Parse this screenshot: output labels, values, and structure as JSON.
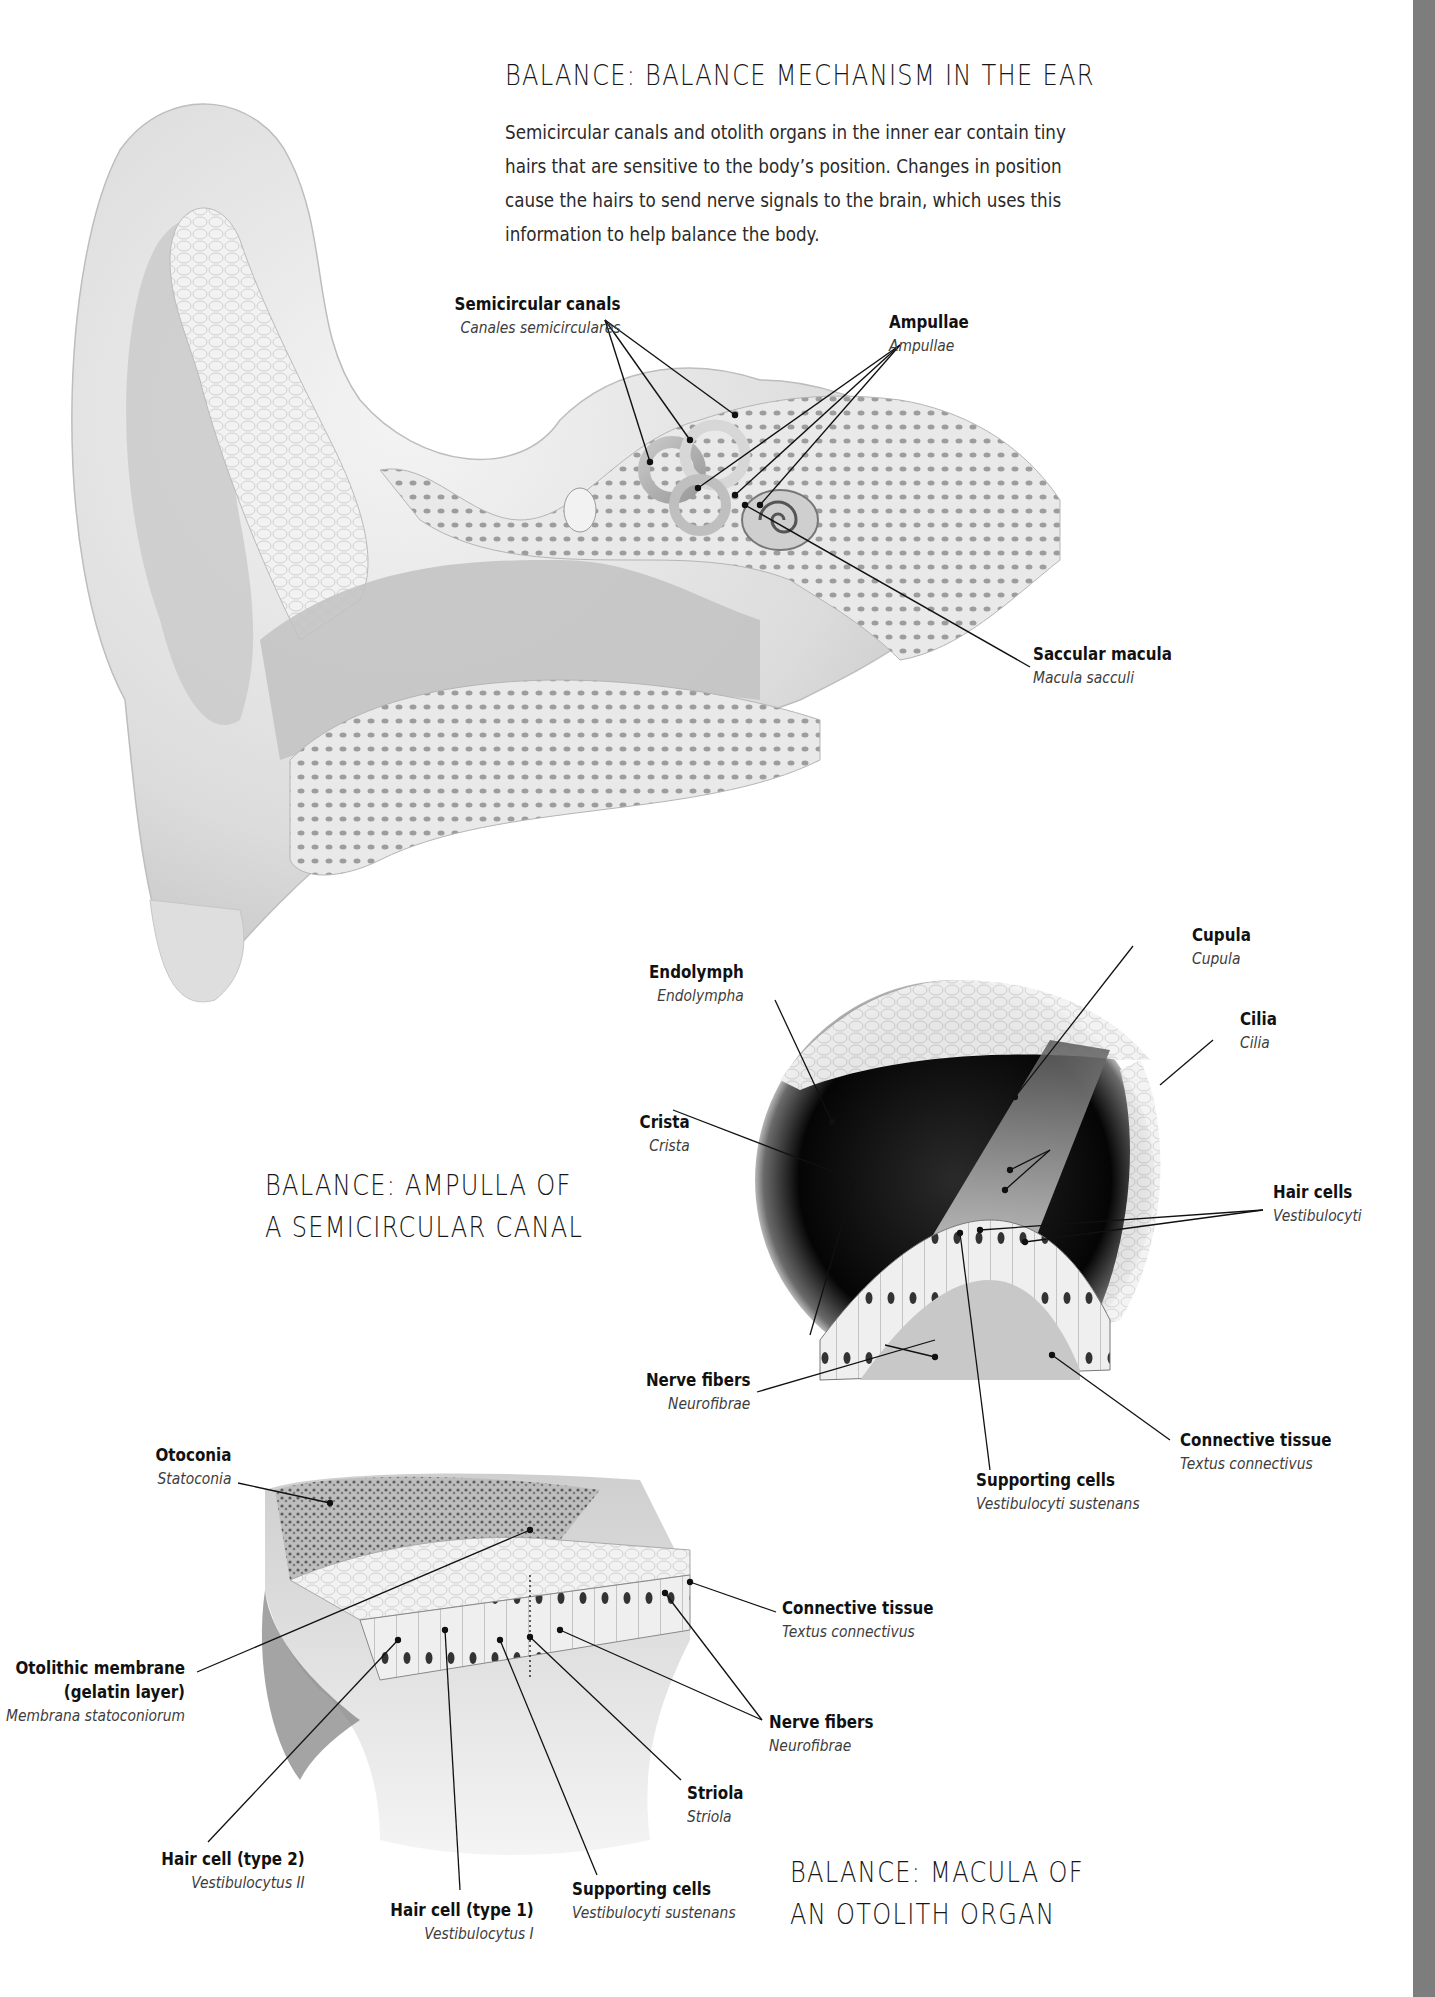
{
  "page": {
    "side_bar_color": "#7d7d7d",
    "background": "#ffffff"
  },
  "section1": {
    "title": "BALANCE: BALANCE MECHANISM IN THE EAR",
    "intro_lines": [
      "Semicircular canals and otolith organs in the inner ear contain tiny",
      "hairs that are sensitive to the body’s position. Changes in position",
      "cause the hairs to send nerve signals to the brain, which uses this",
      "information to help balance the body."
    ],
    "labels": [
      {
        "en": "Semicircular canals",
        "la": "Canales semicirculares"
      },
      {
        "en": "Ampullae",
        "la": "Ampullae"
      },
      {
        "en": "Saccular macula",
        "la": "Macula sacculi"
      }
    ]
  },
  "section2": {
    "title_lines": [
      "BALANCE: AMPULLA OF",
      "A SEMICIRCULAR CANAL"
    ],
    "labels": [
      {
        "en": "Endolymph",
        "la": "Endolympha"
      },
      {
        "en": "Cupula",
        "la": "Cupula"
      },
      {
        "en": "Cilia",
        "la": "Cilia"
      },
      {
        "en": "Crista",
        "la": "Crista"
      },
      {
        "en": "Hair cells",
        "la": "Vestibulocyti"
      },
      {
        "en": "Nerve fibers",
        "la": "Neurofibrae"
      },
      {
        "en": "Connective tissue",
        "la": "Textus connectivus"
      },
      {
        "en": "Supporting cells",
        "la": "Vestibulocyti sustenans"
      }
    ]
  },
  "section3": {
    "title_lines": [
      "BALANCE: MACULA OF",
      "AN OTOLITH ORGAN"
    ],
    "labels": [
      {
        "en": "Otoconia",
        "la": "Statoconia"
      },
      {
        "en": "Connective tissue",
        "la": "Textus connectivus"
      },
      {
        "en_lines": [
          "Otolithic membrane",
          "(gelatin layer)"
        ],
        "la": "Membrana statoconiorum"
      },
      {
        "en": "Nerve fibers",
        "la": "Neurofibrae"
      },
      {
        "en": "Striola",
        "la": "Striola"
      },
      {
        "en": "Hair cell (type 2)",
        "la": "Vestibulocytus II"
      },
      {
        "en": "Supporting cells",
        "la": "Vestibulocyti sustenans"
      },
      {
        "en": "Hair cell (type 1)",
        "la": "Vestibulocytus I"
      }
    ]
  }
}
